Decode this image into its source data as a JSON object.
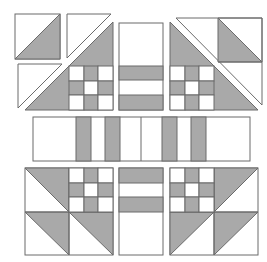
{
  "diagram": {
    "colors": {
      "fill": "#a9a9a9",
      "background": "#ffffff",
      "stroke": "#6b6b6b"
    },
    "units": {
      "hst_top_left": {
        "x": 15,
        "y": 14,
        "size": 45
      },
      "hst_top_left_2": {
        "x": 67,
        "y": 14,
        "size": 45
      },
      "hst_left_under": {
        "x": 17,
        "y": 64,
        "size": 45
      },
      "center_top_column": {
        "x": 119,
        "y": 23,
        "w": 44,
        "h": 87
      },
      "middle_band": {
        "x": 33,
        "y": 117,
        "w": 217,
        "h": 44
      }
    }
  }
}
